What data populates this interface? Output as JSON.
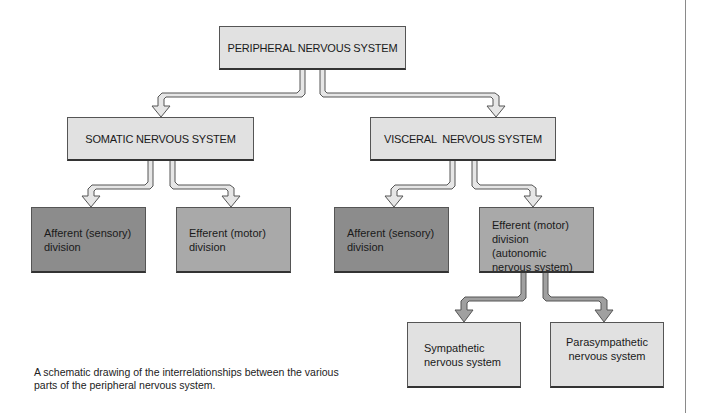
{
  "diagram": {
    "root": {
      "label": "PERIPHERAL NERVOUS SYSTEM"
    },
    "level1": [
      {
        "id": "somatic",
        "label": "SOMATIC NERVOUS SYSTEM"
      },
      {
        "id": "visceral",
        "label": "VISCERAL  NERVOUS SYSTEM"
      }
    ],
    "level2": [
      {
        "id": "somatic-afferent",
        "parent": "somatic",
        "label": "Afferent (sensory) division",
        "shade": "dark"
      },
      {
        "id": "somatic-efferent",
        "parent": "somatic",
        "label": "Efferent (motor) division",
        "shade": "mid"
      },
      {
        "id": "visceral-afferent",
        "parent": "visceral",
        "label": "Afferent (sensory) division",
        "shade": "dark"
      },
      {
        "id": "visceral-efferent",
        "parent": "visceral",
        "label": "Efferent (motor) division (autonomic nervous system)",
        "shade": "mid"
      }
    ],
    "level3": [
      {
        "id": "sympathetic",
        "parent": "visceral-efferent",
        "label": "Sympathetic nervous system"
      },
      {
        "id": "parasympathetic",
        "parent": "visceral-efferent",
        "label": "Parasympathetic nervous system"
      }
    ],
    "colors": {
      "light_box": "#e1e1e1",
      "mid_box": "#a9a9a9",
      "dark_box": "#8c8c8c",
      "arrow_light": "#e6e6e6",
      "arrow_dark": "#a0a0a0",
      "outline": "#555555"
    }
  },
  "caption": "A schematic drawing of the interrelationships between the various parts of the peripheral nervous system."
}
